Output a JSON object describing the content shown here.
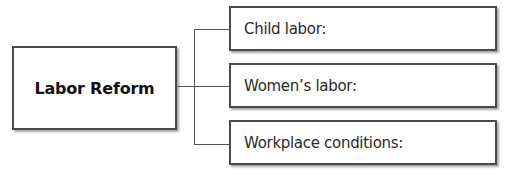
{
  "diagram": {
    "type": "tree",
    "root": {
      "label": "Labor Reform"
    },
    "children": [
      {
        "label": "Child labor:"
      },
      {
        "label": "Women’s labor:"
      },
      {
        "label": "Workplace conditions:"
      }
    ]
  },
  "colors": {
    "border": "#4a4a4a",
    "connector": "#555555",
    "text": "#111111",
    "background": "#ffffff"
  }
}
